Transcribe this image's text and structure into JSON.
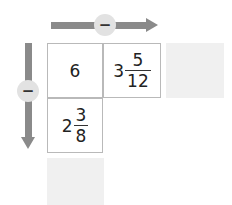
{
  "operations": {
    "horizontal": {
      "symbol": "−",
      "direction": "right"
    },
    "vertical": {
      "symbol": "−",
      "direction": "down"
    }
  },
  "grid": {
    "top_left": {
      "whole": "6"
    },
    "top_right": {
      "whole": "3",
      "numerator": "5",
      "denominator": "12"
    },
    "bottom_left": {
      "whole": "2",
      "numerator": "3",
      "denominator": "8"
    }
  },
  "answers": {
    "right_box": "",
    "bottom_box": ""
  },
  "colors": {
    "arrow": "#8a8a8a",
    "operator_circle": "#e2e2e2",
    "answer_box": "#f0f0f0",
    "cell_border": "#b9b9b9"
  }
}
